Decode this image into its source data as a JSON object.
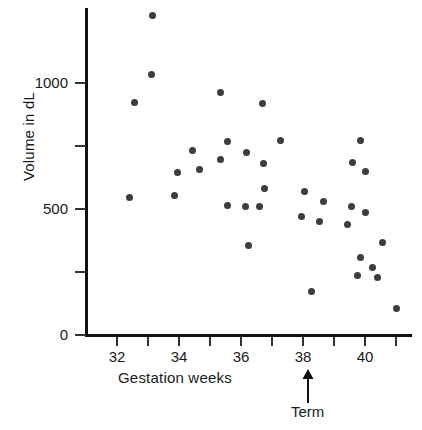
{
  "chart_data": {
    "type": "scatter",
    "title": "",
    "xlabel": "Gestation weeks",
    "ylabel": "Volume in dL",
    "xlim": [
      31,
      41.5
    ],
    "ylim": [
      0,
      1300
    ],
    "grid": false,
    "legend": null,
    "x_ticks": [
      {
        "value": 32,
        "label": "32"
      },
      {
        "value": 33,
        "label": ""
      },
      {
        "value": 34,
        "label": "34"
      },
      {
        "value": 35,
        "label": ""
      },
      {
        "value": 36,
        "label": "36"
      },
      {
        "value": 37,
        "label": ""
      },
      {
        "value": 38,
        "label": "38"
      },
      {
        "value": 39,
        "label": ""
      },
      {
        "value": 40,
        "label": "40"
      },
      {
        "value": 41,
        "label": ""
      }
    ],
    "y_ticks": [
      {
        "value": 0,
        "label": "0"
      },
      {
        "value": 250,
        "label": ""
      },
      {
        "value": 500,
        "label": "500"
      },
      {
        "value": 750,
        "label": ""
      },
      {
        "value": 1000,
        "label": "1000"
      }
    ],
    "point_color": "#3d3d3d",
    "axis_color": "#111111",
    "annotations": [
      {
        "name": "term-marker",
        "label": "Term",
        "x": 38.15,
        "kind": "up-arrow"
      }
    ],
    "points": [
      {
        "x": 33.13,
        "y": 1268
      },
      {
        "x": 33.1,
        "y": 1033
      },
      {
        "x": 32.58,
        "y": 922
      },
      {
        "x": 35.35,
        "y": 964
      },
      {
        "x": 36.68,
        "y": 917
      },
      {
        "x": 35.55,
        "y": 766
      },
      {
        "x": 34.45,
        "y": 731
      },
      {
        "x": 36.19,
        "y": 726
      },
      {
        "x": 37.26,
        "y": 770
      },
      {
        "x": 39.87,
        "y": 770
      },
      {
        "x": 35.35,
        "y": 695
      },
      {
        "x": 36.71,
        "y": 679
      },
      {
        "x": 39.61,
        "y": 683
      },
      {
        "x": 33.94,
        "y": 644
      },
      {
        "x": 34.65,
        "y": 655
      },
      {
        "x": 40.03,
        "y": 647
      },
      {
        "x": 36.77,
        "y": 580
      },
      {
        "x": 38.06,
        "y": 568
      },
      {
        "x": 32.39,
        "y": 544
      },
      {
        "x": 33.84,
        "y": 552
      },
      {
        "x": 35.58,
        "y": 513
      },
      {
        "x": 36.16,
        "y": 508
      },
      {
        "x": 36.61,
        "y": 508
      },
      {
        "x": 38.65,
        "y": 528
      },
      {
        "x": 39.55,
        "y": 508
      },
      {
        "x": 40.03,
        "y": 488
      },
      {
        "x": 37.94,
        "y": 469
      },
      {
        "x": 38.52,
        "y": 449
      },
      {
        "x": 39.45,
        "y": 437
      },
      {
        "x": 36.23,
        "y": 357
      },
      {
        "x": 40.55,
        "y": 369
      },
      {
        "x": 39.84,
        "y": 306
      },
      {
        "x": 40.23,
        "y": 266
      },
      {
        "x": 39.77,
        "y": 238
      },
      {
        "x": 40.39,
        "y": 230
      },
      {
        "x": 38.26,
        "y": 171
      },
      {
        "x": 41.0,
        "y": 107
      }
    ]
  }
}
